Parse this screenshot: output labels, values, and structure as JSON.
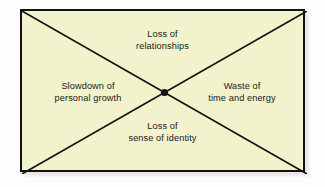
{
  "diagram": {
    "type": "x-quadrant-consequences",
    "fill_color": "#f2f2cc",
    "border_color": "#111111",
    "line_color": "#111111",
    "text_color": "#1a1a1a",
    "center_node": {
      "name": "center-dot",
      "shape": "filled-circle",
      "color": "#111111"
    },
    "quadrants": {
      "top": {
        "line1": "Loss of",
        "line2": "relationships"
      },
      "left": {
        "line1": "Slowdown of",
        "line2": "personal growth"
      },
      "right": {
        "line1": "Waste of",
        "line2": "time and energy"
      },
      "bottom": {
        "line1": "Loss of",
        "line2": "sense of identity"
      }
    }
  }
}
